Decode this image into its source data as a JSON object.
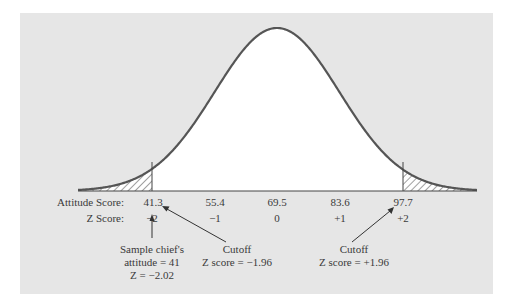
{
  "chart_data": {
    "type": "area",
    "title": "",
    "row_labels": {
      "attitude": "Attitude Score:",
      "z": "Z Score:"
    },
    "attitude_ticks": [
      "41.3",
      "55.4",
      "69.5",
      "83.6",
      "97.7"
    ],
    "z_ticks": [
      "−2",
      "−1",
      "0",
      "+1",
      "+2"
    ],
    "mean": 69.5,
    "sd": 14.1,
    "shaded_regions": [
      {
        "side": "left",
        "below_z": -1.96
      },
      {
        "side": "right",
        "above_z": 1.96
      }
    ],
    "annotations": {
      "sample": [
        "Sample chief's",
        "attitude = 41",
        "Z = −2.02"
      ],
      "left_cutoff": [
        "Cutoff",
        "Z score = −1.96"
      ],
      "right_cutoff": [
        "Cutoff",
        "Z score = +1.96"
      ]
    }
  },
  "colors": {
    "panel": "#e6e6e6",
    "curve": "#555555",
    "fill": "#ffffff"
  }
}
